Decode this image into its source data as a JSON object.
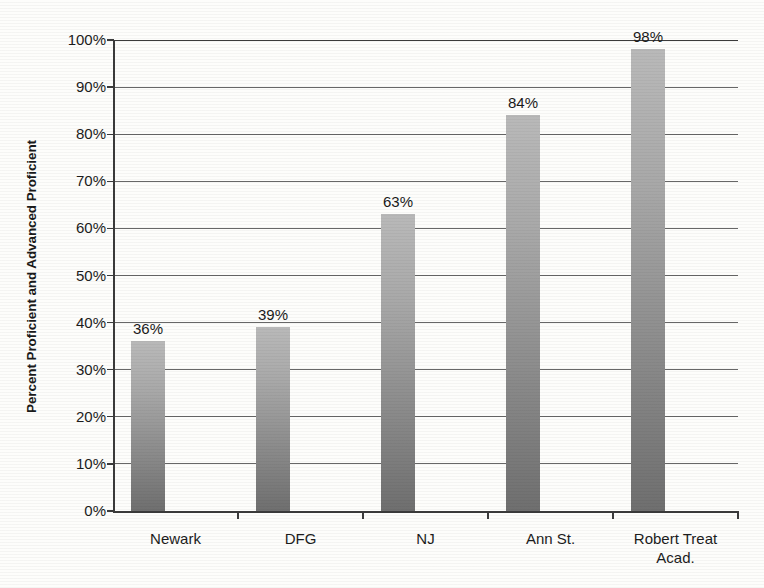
{
  "chart_data": {
    "type": "bar",
    "title": "",
    "subtitle": "",
    "xlabel": "",
    "ylabel": "Percent Proficient and Advanced Proficient",
    "categories": [
      "Newark",
      "DFG",
      "NJ",
      "Ann St.",
      "Robert Treat Acad."
    ],
    "values": [
      36,
      39,
      63,
      84,
      98
    ],
    "value_labels": [
      "36%",
      "39%",
      "63%",
      "84%",
      "98%"
    ],
    "ylim": [
      0,
      100
    ],
    "ytick_values": [
      0,
      10,
      20,
      30,
      40,
      50,
      60,
      70,
      80,
      90,
      100
    ],
    "ytick_labels": [
      "0%",
      "10%",
      "20%",
      "30%",
      "40%",
      "50%",
      "60%",
      "70%",
      "80%",
      "90%",
      "100%"
    ],
    "grid": true,
    "grid_axis": "y",
    "legend": false,
    "legend_position": "none",
    "bar_color": "#9a9a9a",
    "bar_gradient": [
      "#b9b9b9",
      "#6f6f6f"
    ],
    "axis_color": "#3b3b3b",
    "background_color": "#fdfdfb",
    "text_color": "#1c1c1c"
  },
  "axis": {
    "y_title": "Percent Proficient and Advanced Proficient"
  },
  "category_labels": [
    {
      "line1": "Newark",
      "line2": ""
    },
    {
      "line1": "DFG",
      "line2": ""
    },
    {
      "line1": "NJ",
      "line2": ""
    },
    {
      "line1": "Ann St.",
      "line2": ""
    },
    {
      "line1": "Robert Treat",
      "line2": "Acad."
    }
  ]
}
